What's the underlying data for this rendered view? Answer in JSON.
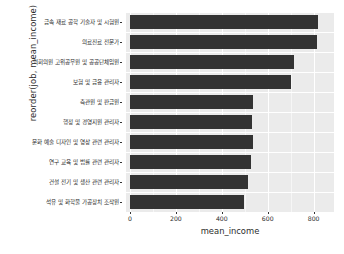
{
  "chart_data": {
    "type": "bar",
    "orientation": "horizontal",
    "title": "",
    "xlabel": "mean_income",
    "ylabel": "reorder(job, mean_income)",
    "xlim": [
      0,
      880
    ],
    "grid": true,
    "legend": "none",
    "xticks": [
      0,
      200,
      400,
      600,
      800
    ],
    "xtick_labels": [
      "0",
      "200",
      "400",
      "600",
      "800"
    ],
    "categories": [
      "금속 재료 공학 기술자 및 시험원",
      "의료진료 전문가",
      "의회의원 고위공무원 및 공공단체임원",
      "보험 및 금융 관리자",
      "측관원 및 판금원",
      "행정 및 경영지원 관리자",
      "문화 예술 디자인 및 영상 관련 관리자",
      "연구 교육 및 법률 관련 관리자",
      "건설 전기 및 생산 관련 관리자",
      "석유 및 화학물 가공장치 조작원"
    ],
    "values": [
      820,
      816,
      716,
      703,
      536,
      532,
      536,
      525,
      513,
      497
    ],
    "bar_color": "#333333",
    "panel_color": "#ebebeb",
    "grid_color": "#ffffff"
  }
}
